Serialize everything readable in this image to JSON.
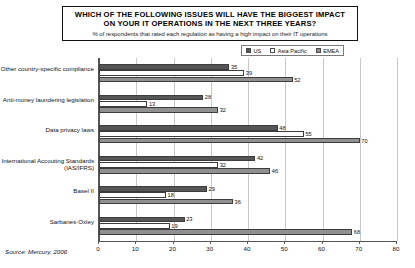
{
  "title": {
    "line1": "WHICH OF THE FOLLOWING ISSUES WILL HAVE THE BIGGEST IMPACT",
    "line2": "ON YOUR IT OPERATIONS IN THE NEXT THREE YEARS?",
    "subtitle": "% of respondents that rated each regulation as having a high impact on their IT operations"
  },
  "source": "Source: Mercury, 2006",
  "chart_data": {
    "type": "bar",
    "orientation": "horizontal",
    "title": "WHICH OF THE FOLLOWING ISSUES WILL HAVE THE BIGGEST IMPACT ON YOUR IT OPERATIONS IN THE NEXT THREE YEARS?",
    "subtitle": "% of respondents that rated each regulation as having a high impact on their IT operations",
    "xlabel": "",
    "ylabel": "",
    "xlim": [
      0,
      80
    ],
    "xticks": [
      0,
      10,
      20,
      30,
      40,
      50,
      60,
      70,
      80
    ],
    "grid": true,
    "legend_position": "top-right",
    "categories": [
      "Other country-specific compliance",
      "Anti-money laundering legislation",
      "Data privacy laws",
      "International Accouting Standards (IAS/IFRS)",
      "Basel II",
      "Sarbanes-Oxley"
    ],
    "series": [
      {
        "name": "US",
        "color": "#555555",
        "values": [
          35,
          28,
          48,
          42,
          29,
          23
        ]
      },
      {
        "name": "Asia Pacific",
        "color": "#ffffff",
        "values": [
          39,
          13,
          55,
          32,
          18,
          19
        ]
      },
      {
        "name": "EMEA",
        "color": "#909090",
        "values": [
          52,
          32,
          70,
          46,
          36,
          68
        ]
      }
    ]
  }
}
